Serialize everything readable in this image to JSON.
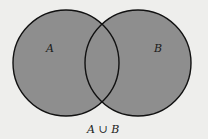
{
  "diagram": {
    "type": "venn",
    "sets": [
      {
        "label": "A",
        "cx": 66,
        "cy": 63,
        "r": 53
      },
      {
        "label": "B",
        "cx": 138,
        "cy": 63,
        "r": 53
      }
    ],
    "caption": "A ∪ B",
    "shaded_region": "union",
    "colors": {
      "fill": "#8e8e8e",
      "stroke": "#111111",
      "background": "#eeeeec"
    }
  }
}
